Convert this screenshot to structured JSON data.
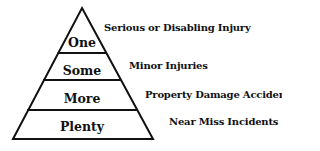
{
  "diagram": {
    "type": "safety-pyramid",
    "levels": [
      {
        "label": "One",
        "description": "Serious or Disabling Injury"
      },
      {
        "label": "Some",
        "description": "Minor Injuries"
      },
      {
        "label": "More",
        "description": "Property Damage Accidents"
      },
      {
        "label": "Plenty",
        "description": "Near Miss Incidents"
      }
    ],
    "colors": {
      "stroke": "#111111",
      "background": "#ffffff"
    }
  }
}
